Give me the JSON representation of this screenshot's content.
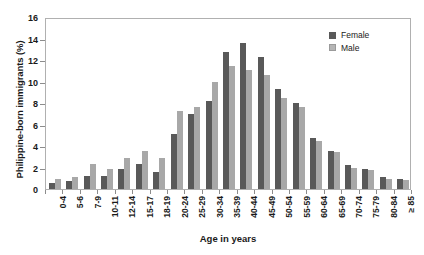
{
  "chart_data": {
    "type": "bar",
    "title": "",
    "xlabel": "Age in years",
    "ylabel": "Philippine-born immigrants (%)",
    "ylim": [
      0,
      16
    ],
    "yticks": [
      0,
      2,
      4,
      6,
      8,
      10,
      12,
      14,
      16
    ],
    "grid": false,
    "legend_position": "top-right",
    "categories": [
      "0-4",
      "5-6",
      "7-9",
      "10-11",
      "12-14",
      "15-17",
      "18-19",
      "20-24",
      "25-29",
      "30-34",
      "35-39",
      "40-44",
      "45-49",
      "50-54",
      "55-59",
      "60-64",
      "65-69",
      "70-74",
      "75-79",
      "80-84",
      "≥ 85"
    ],
    "series": [
      {
        "name": "Female",
        "color": "#595959",
        "values": [
          0.6,
          0.7,
          1.2,
          1.25,
          1.9,
          2.35,
          1.6,
          5.1,
          7.0,
          8.2,
          12.7,
          13.6,
          12.3,
          9.3,
          8.0,
          4.7,
          3.5,
          2.2,
          1.9,
          1.1,
          0.9
        ]
      },
      {
        "name": "Male",
        "color": "#a8a8a8",
        "values": [
          0.9,
          1.15,
          2.3,
          1.9,
          2.9,
          3.5,
          2.9,
          7.3,
          7.65,
          10.0,
          11.4,
          11.1,
          10.6,
          8.5,
          7.6,
          4.5,
          3.4,
          2.0,
          1.75,
          0.95,
          0.85
        ]
      }
    ]
  },
  "legend": {
    "items": [
      {
        "label": "Female",
        "color": "#595959"
      },
      {
        "label": "Male",
        "color": "#b5b5b5"
      }
    ]
  },
  "axes": {
    "y_title": "Philippine-born immigrants (%)",
    "x_title": "Age in years"
  }
}
